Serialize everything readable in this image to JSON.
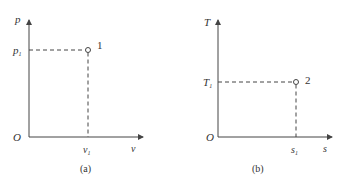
{
  "colors": {
    "line": "#444444",
    "text": "#333333",
    "background": "#ffffff"
  },
  "panels": [
    {
      "caption": "(a)",
      "y_axis_label": "p",
      "x_axis_label": "v",
      "origin_label": "O",
      "y_tick_label": "p",
      "y_tick_sub": "1",
      "x_tick_label": "v",
      "x_tick_sub": "1",
      "point_label": "1"
    },
    {
      "caption": "(b)",
      "y_axis_label": "T",
      "x_axis_label": "s",
      "origin_label": "O",
      "y_tick_label": "T",
      "y_tick_sub": "1",
      "x_tick_label": "s",
      "x_tick_sub": "1",
      "point_label": "2"
    }
  ]
}
